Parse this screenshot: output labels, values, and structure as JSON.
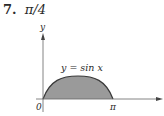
{
  "problem": {
    "number": "7.",
    "answer": "π/4"
  },
  "figure": {
    "y_axis_label": "y",
    "curve_label": "y = sin x",
    "origin_label": "0",
    "x_tick_label": "π",
    "fill_color": "#9a9a9a",
    "curve_color": "#3a3a3a",
    "axis_color": "#555555"
  }
}
